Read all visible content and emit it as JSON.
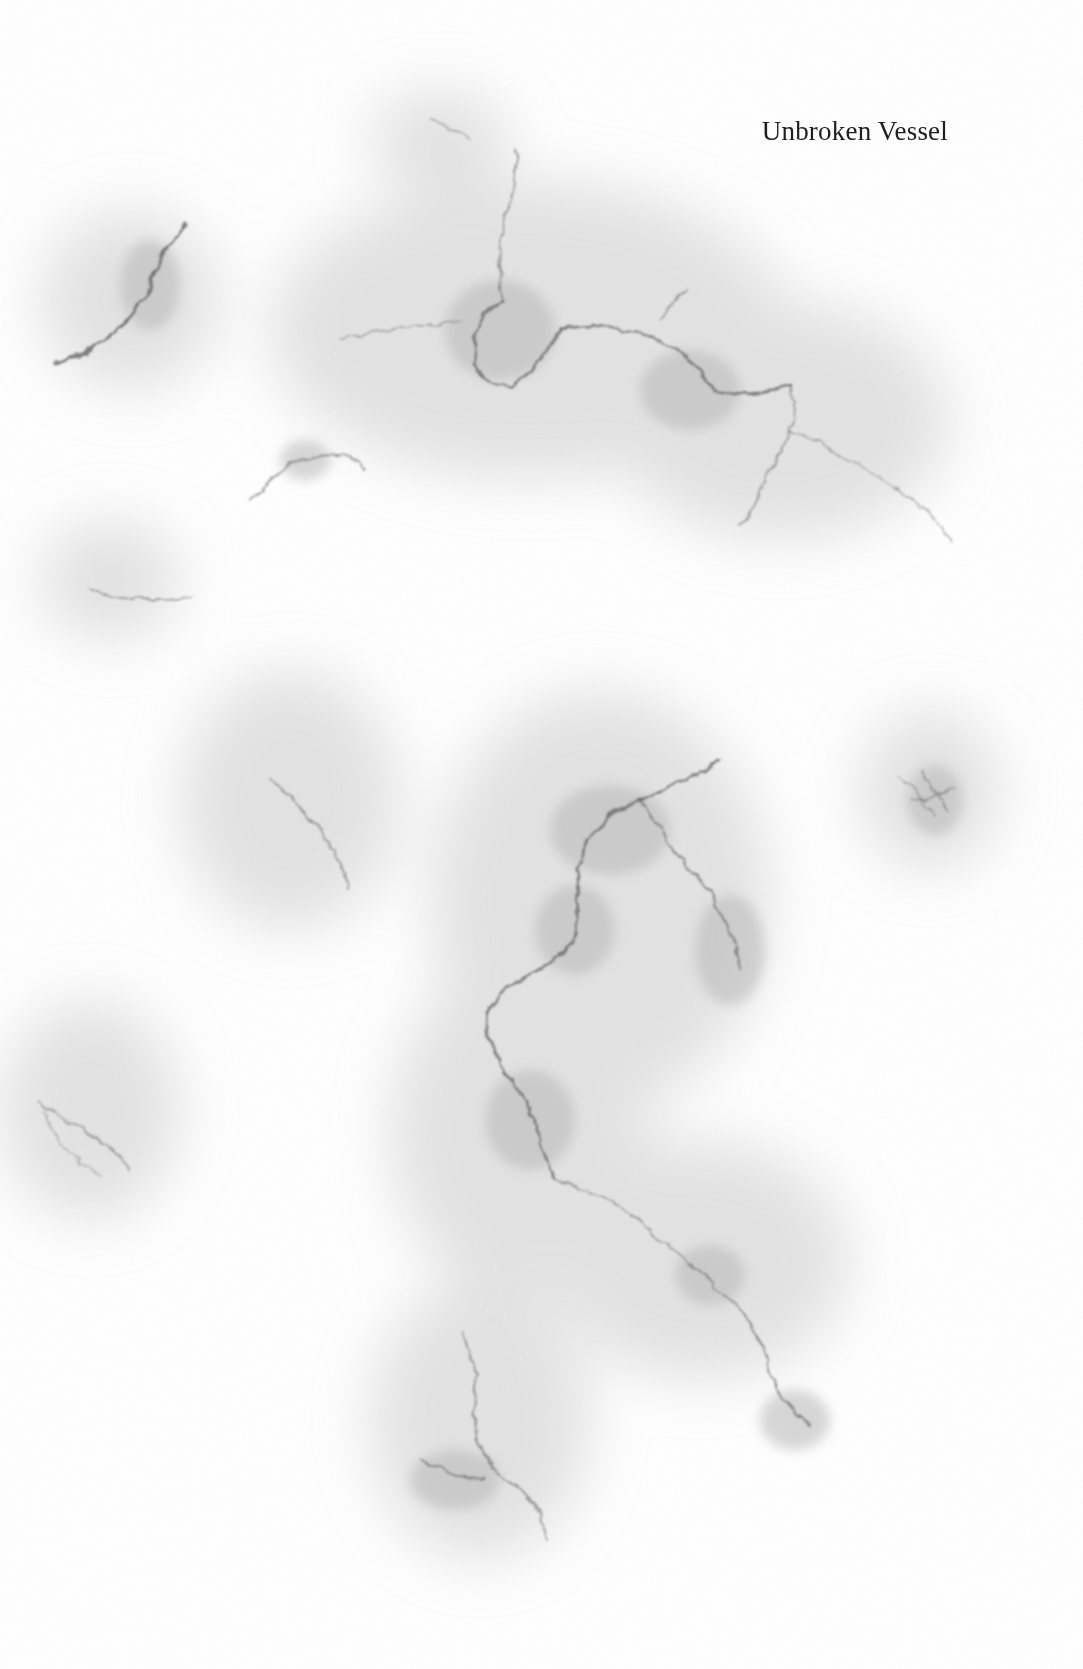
{
  "page": {
    "title": "Unbroken Vessel",
    "background_color": "#ffffff",
    "texture": "gray-marble-veins",
    "text_color": "#1e1e1e",
    "vein_color": "#555555"
  }
}
